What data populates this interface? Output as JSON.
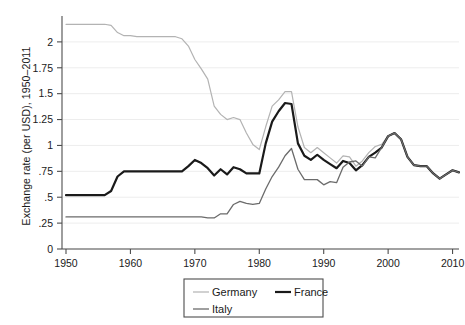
{
  "chart_data": {
    "type": "line",
    "title": "",
    "xlabel": "",
    "ylabel": "Exchange rate (per USD), 1950–2011",
    "xlim": [
      1950,
      2011
    ],
    "ylim": [
      0,
      2.25
    ],
    "xticks": [
      1950,
      1960,
      1970,
      1980,
      1990,
      2000,
      2010
    ],
    "xticklabels": [
      "1950",
      "1960",
      "1970",
      "1980",
      "1990",
      "2000",
      "2010"
    ],
    "yticks": [
      0,
      0.25,
      0.5,
      0.75,
      1,
      1.25,
      1.5,
      1.75,
      2
    ],
    "yticklabels": [
      "0",
      ".25",
      ".5",
      ".75",
      "1",
      "1.25",
      "1.5",
      "1.75",
      "2"
    ],
    "grid": "horizontal",
    "legend_position": "below-center",
    "series": [
      {
        "name": "Germany",
        "color": "#b3b3b3",
        "width": 1.2,
        "x": [
          1950,
          1951,
          1952,
          1953,
          1954,
          1955,
          1956,
          1957,
          1958,
          1959,
          1960,
          1961,
          1962,
          1963,
          1964,
          1965,
          1966,
          1967,
          1968,
          1969,
          1970,
          1971,
          1972,
          1973,
          1974,
          1975,
          1976,
          1977,
          1978,
          1979,
          1980,
          1981,
          1982,
          1983,
          1984,
          1985,
          1986,
          1987,
          1988,
          1989,
          1990,
          1991,
          1992,
          1993,
          1994,
          1995,
          1996,
          1997,
          1998,
          1999,
          2000,
          2001,
          2002,
          2003,
          2004,
          2005,
          2006,
          2007,
          2008,
          2009,
          2010,
          2011
        ],
        "values": [
          2.17,
          2.17,
          2.17,
          2.17,
          2.17,
          2.17,
          2.17,
          2.16,
          2.09,
          2.06,
          2.06,
          2.05,
          2.05,
          2.05,
          2.05,
          2.05,
          2.05,
          2.05,
          2.03,
          1.96,
          1.83,
          1.74,
          1.64,
          1.38,
          1.3,
          1.25,
          1.27,
          1.25,
          1.12,
          1.01,
          0.96,
          1.18,
          1.38,
          1.44,
          1.52,
          1.52,
          1.18,
          0.98,
          0.93,
          0.98,
          0.93,
          0.88,
          0.83,
          0.9,
          0.89,
          0.8,
          0.85,
          0.93,
          0.99,
          1.01,
          1.09,
          1.12,
          1.06,
          0.89,
          0.81,
          0.8,
          0.8,
          0.73,
          0.68,
          0.72,
          0.76,
          0.74
        ]
      },
      {
        "name": "France",
        "color": "#1a1a1a",
        "width": 2.2,
        "x": [
          1950,
          1951,
          1952,
          1953,
          1954,
          1955,
          1956,
          1957,
          1958,
          1959,
          1960,
          1961,
          1962,
          1963,
          1964,
          1965,
          1966,
          1967,
          1968,
          1969,
          1970,
          1971,
          1972,
          1973,
          1974,
          1975,
          1976,
          1977,
          1978,
          1979,
          1980,
          1981,
          1982,
          1983,
          1984,
          1985,
          1986,
          1987,
          1988,
          1989,
          1990,
          1991,
          1992,
          1993,
          1994,
          1995,
          1996,
          1997,
          1998,
          1999,
          2000,
          2001,
          2002,
          2003,
          2004,
          2005,
          2006,
          2007,
          2008,
          2009,
          2010,
          2011
        ],
        "values": [
          0.52,
          0.52,
          0.52,
          0.52,
          0.52,
          0.52,
          0.52,
          0.56,
          0.7,
          0.75,
          0.75,
          0.75,
          0.75,
          0.75,
          0.75,
          0.75,
          0.75,
          0.75,
          0.75,
          0.8,
          0.86,
          0.83,
          0.78,
          0.71,
          0.77,
          0.72,
          0.79,
          0.77,
          0.73,
          0.73,
          0.73,
          1.02,
          1.23,
          1.33,
          1.41,
          1.4,
          1.02,
          0.9,
          0.86,
          0.91,
          0.86,
          0.82,
          0.78,
          0.85,
          0.83,
          0.76,
          0.81,
          0.89,
          0.93,
          0.98,
          1.09,
          1.12,
          1.06,
          0.89,
          0.81,
          0.8,
          0.8,
          0.73,
          0.68,
          0.72,
          0.76,
          0.74
        ]
      },
      {
        "name": "Italy",
        "color": "#6b6b6b",
        "width": 1.3,
        "x": [
          1950,
          1951,
          1952,
          1953,
          1954,
          1955,
          1956,
          1957,
          1958,
          1959,
          1960,
          1961,
          1962,
          1963,
          1964,
          1965,
          1966,
          1967,
          1968,
          1969,
          1970,
          1971,
          1972,
          1973,
          1974,
          1975,
          1976,
          1977,
          1978,
          1979,
          1980,
          1981,
          1982,
          1983,
          1984,
          1985,
          1986,
          1987,
          1988,
          1989,
          1990,
          1991,
          1992,
          1993,
          1994,
          1995,
          1996,
          1997,
          1998,
          1999,
          2000,
          2001,
          2002,
          2003,
          2004,
          2005,
          2006,
          2007,
          2008,
          2009,
          2010,
          2011
        ],
        "values": [
          0.31,
          0.31,
          0.31,
          0.31,
          0.31,
          0.31,
          0.31,
          0.31,
          0.31,
          0.31,
          0.31,
          0.31,
          0.31,
          0.31,
          0.31,
          0.31,
          0.31,
          0.31,
          0.31,
          0.31,
          0.31,
          0.31,
          0.3,
          0.3,
          0.34,
          0.34,
          0.43,
          0.46,
          0.44,
          0.43,
          0.44,
          0.58,
          0.7,
          0.79,
          0.9,
          0.97,
          0.77,
          0.67,
          0.67,
          0.67,
          0.62,
          0.65,
          0.64,
          0.79,
          0.84,
          0.85,
          0.8,
          0.89,
          0.88,
          0.98,
          1.09,
          1.12,
          1.06,
          0.89,
          0.81,
          0.8,
          0.8,
          0.73,
          0.68,
          0.72,
          0.76,
          0.74
        ]
      }
    ]
  },
  "legend": {
    "entries": [
      {
        "label": "Germany",
        "color": "#b3b3b3"
      },
      {
        "label": "France",
        "color": "#1a1a1a"
      },
      {
        "label": "Italy",
        "color": "#6b6b6b"
      }
    ]
  }
}
